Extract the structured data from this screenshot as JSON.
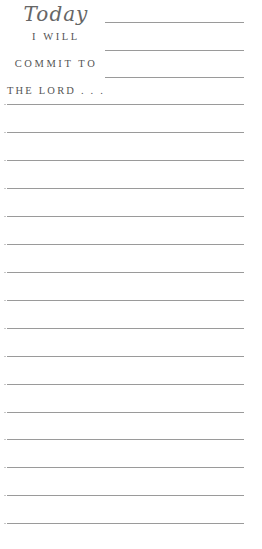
{
  "heading": {
    "title": "Today",
    "line1": "I WILL",
    "line2": "COMMIT TO",
    "line3": "THE LORD . . ."
  },
  "short_lines": [
    22,
    50,
    77
  ],
  "full_lines": [
    104,
    132,
    160,
    188,
    216,
    244,
    272,
    300,
    328,
    356,
    384,
    412,
    439,
    467,
    495,
    523
  ],
  "colors": {
    "rule": "#9a9a9a",
    "text": "#555555"
  }
}
